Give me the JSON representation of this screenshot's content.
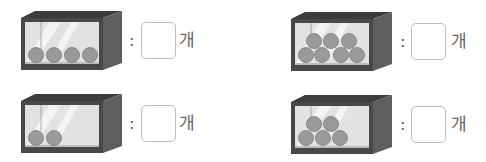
{
  "colors": {
    "frame_front": "#4a4a4a",
    "frame_side": "#5e5e5e",
    "frame_top": "#3c3c3c",
    "glass": "#e4e4e4",
    "glass_highlight": "#f6f6f6",
    "ball": "#9a9a9a",
    "ball_edge": "#7a7a7a"
  },
  "items": [
    {
      "id": 1,
      "balls": 4,
      "colon": ":",
      "answer": "",
      "unit": "개"
    },
    {
      "id": 2,
      "balls": 7,
      "colon": ":",
      "answer": "",
      "unit": "개"
    },
    {
      "id": 3,
      "balls": 2,
      "colon": ":",
      "answer": "",
      "unit": "개"
    },
    {
      "id": 4,
      "balls": 5,
      "colon": ":",
      "answer": "",
      "unit": "개"
    }
  ]
}
